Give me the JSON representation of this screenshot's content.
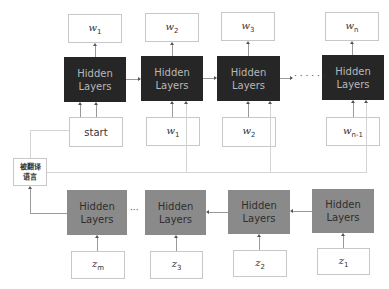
{
  "diagram": {
    "type": "seq2seq-encoder-decoder",
    "decoder": {
      "block_label_line1": "Hidden",
      "block_label_line2": "Layers",
      "color": "#262626",
      "outputs": [
        {
          "base": "w",
          "sub": "1"
        },
        {
          "base": "w",
          "sub": "2"
        },
        {
          "base": "w",
          "sub": "3"
        },
        {
          "base": "w",
          "sub": "n"
        }
      ],
      "inputs": [
        {
          "base": "start",
          "sub": ""
        },
        {
          "base": "w",
          "sub": "1"
        },
        {
          "base": "w",
          "sub": "2"
        },
        {
          "base": "w",
          "sub": "n-1"
        }
      ],
      "ellipsis": "· · · · · ·"
    },
    "encoder": {
      "block_label_line1": "Hidden",
      "block_label_line2": "Layers",
      "color": "#8a8a8a",
      "inputs": [
        {
          "base": "z",
          "sub": "m"
        },
        {
          "base": "z",
          "sub": "3"
        },
        {
          "base": "z",
          "sub": "2"
        },
        {
          "base": "z",
          "sub": "1"
        }
      ],
      "ellipsis": "···"
    },
    "context_box": {
      "line1": "被翻译",
      "line2": "语言"
    }
  }
}
